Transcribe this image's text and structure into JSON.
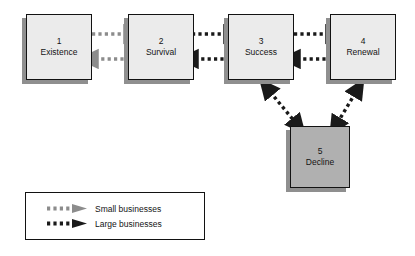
{
  "diagram": {
    "palette": {
      "box_light": "#ebebeb",
      "box_dark": "#b0b0b0",
      "box_border": "#121212",
      "shadow": "#8f8f8f",
      "small_business_arrow": "#8c8c8c",
      "large_business_arrow": "#1a1a1a",
      "background": "#ffffff"
    },
    "nodes": [
      {
        "id": "existence",
        "number": "1",
        "name": "Existence",
        "fill": "light"
      },
      {
        "id": "survival",
        "number": "2",
        "name": "Survival",
        "fill": "light"
      },
      {
        "id": "success",
        "number": "3",
        "name": "Success",
        "fill": "light"
      },
      {
        "id": "renewal",
        "number": "4",
        "name": "Renewal",
        "fill": "light"
      },
      {
        "id": "decline",
        "number": "5",
        "name": "Decline",
        "fill": "dark"
      }
    ],
    "edges": [
      {
        "from": "existence",
        "to": "survival",
        "direction": "forward",
        "style": "small"
      },
      {
        "from": "survival",
        "to": "existence",
        "direction": "backward",
        "style": "small"
      },
      {
        "from": "survival",
        "to": "success",
        "direction": "forward",
        "style": "large"
      },
      {
        "from": "success",
        "to": "survival",
        "direction": "backward",
        "style": "large"
      },
      {
        "from": "success",
        "to": "renewal",
        "direction": "forward",
        "style": "large"
      },
      {
        "from": "renewal",
        "to": "success",
        "direction": "backward",
        "style": "large"
      },
      {
        "from": "success",
        "to": "decline",
        "direction": "bidirectional",
        "style": "large"
      },
      {
        "from": "renewal",
        "to": "decline",
        "direction": "bidirectional",
        "style": "large"
      }
    ]
  },
  "legend": {
    "items": [
      {
        "id": "small",
        "label": "Small businesses",
        "color": "#8c8c8c"
      },
      {
        "id": "large",
        "label": "Large businesses",
        "color": "#1a1a1a"
      }
    ]
  }
}
